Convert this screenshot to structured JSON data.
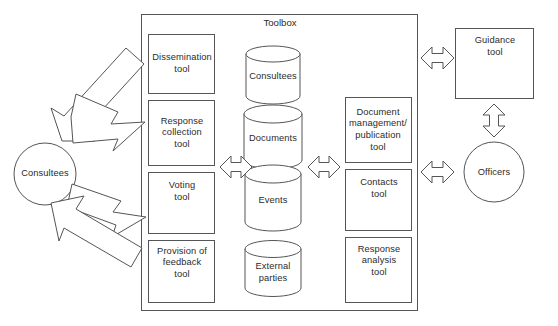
{
  "diagram": {
    "title": "Toolbox",
    "toolbox": {
      "label": "Toolbox",
      "left_tools": [
        {
          "name": "dissemination-tool",
          "label": "Dissemination\ntool"
        },
        {
          "name": "response-collection-tool",
          "label": "Response\ncollection\ntool"
        },
        {
          "name": "voting-tool",
          "label": "Voting\ntool"
        },
        {
          "name": "provision-of-feedback-tool",
          "label": "Provision of\nfeedback\ntool"
        }
      ],
      "data_stores": [
        {
          "name": "consultees-store",
          "label": "Consultees"
        },
        {
          "name": "documents-store",
          "label": "Documents"
        },
        {
          "name": "events-store",
          "label": "Events"
        },
        {
          "name": "external-parties-store",
          "label": "External\nparties"
        }
      ],
      "right_tools": [
        {
          "name": "document-management-publication-tool",
          "label": "Document\nmanagement/\npublication\ntool"
        },
        {
          "name": "contacts-tool",
          "label": "Contacts\ntool"
        },
        {
          "name": "response-analysis-tool",
          "label": "Response\nanalysis\ntool"
        }
      ]
    },
    "actors": {
      "consultees": "Consultees",
      "officers": "Officers"
    },
    "external_tools": {
      "guidance_tool": "Guidance\ntool"
    },
    "connectors": [
      {
        "name": "consultees-to-dissemination-arrow",
        "direction": "in",
        "kind": "block-arrow"
      },
      {
        "name": "consultees-to-response-collection-arrow",
        "direction": "out",
        "kind": "block-arrow"
      },
      {
        "name": "consultees-to-voting-arrow",
        "direction": "out",
        "kind": "block-arrow"
      },
      {
        "name": "consultees-to-feedback-arrow",
        "direction": "in",
        "kind": "block-arrow"
      },
      {
        "name": "left-tools-to-stores-arrow",
        "direction": "both",
        "kind": "double-arrow"
      },
      {
        "name": "stores-to-right-tools-arrow",
        "direction": "both",
        "kind": "double-arrow"
      },
      {
        "name": "toolbox-to-guidance-arrow",
        "direction": "both",
        "kind": "double-arrow"
      },
      {
        "name": "toolbox-to-officers-arrow",
        "direction": "both",
        "kind": "double-arrow"
      },
      {
        "name": "guidance-to-officers-arrow",
        "direction": "both",
        "kind": "double-arrow-vertical"
      }
    ],
    "colors": {
      "stroke": "#555555",
      "fill": "#ffffff",
      "text": "#2b2b2b"
    }
  }
}
